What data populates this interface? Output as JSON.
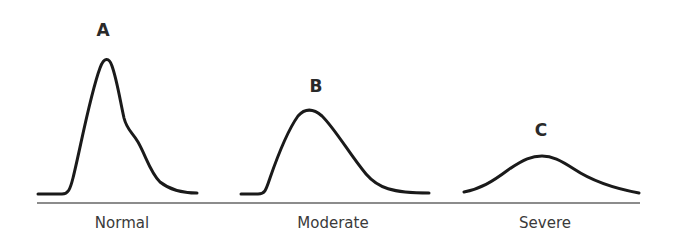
{
  "diagram": {
    "type": "distribution-curves",
    "colors": {
      "curve": "#1a1a1a",
      "baseline": "#555555",
      "text": "#333333"
    },
    "panels": [
      {
        "peak_label": "A",
        "category": "Normal"
      },
      {
        "peak_label": "B",
        "category": "Moderate"
      },
      {
        "peak_label": "C",
        "category": "Severe"
      }
    ]
  }
}
